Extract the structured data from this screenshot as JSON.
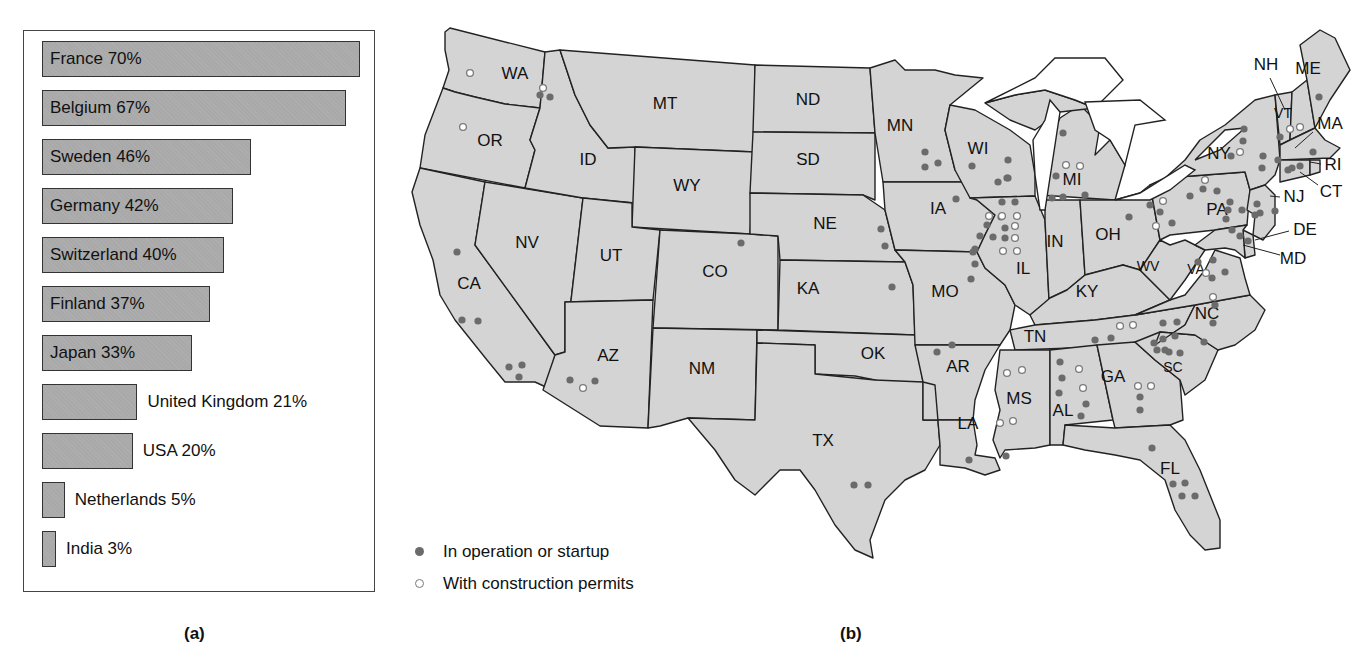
{
  "panel_a": {
    "caption": "(a)",
    "bars": [
      {
        "country": "France",
        "percent": 70,
        "label": "France 70%",
        "label_inside": true
      },
      {
        "country": "Belgium",
        "percent": 67,
        "label": "Belgium 67%",
        "label_inside": true
      },
      {
        "country": "Sweden",
        "percent": 46,
        "label": "Sweden 46%",
        "label_inside": true
      },
      {
        "country": "Germany",
        "percent": 42,
        "label": "Germany 42%",
        "label_inside": true
      },
      {
        "country": "Switzerland",
        "percent": 40,
        "label": "Switzerland 40%",
        "label_inside": true
      },
      {
        "country": "Finland",
        "percent": 37,
        "label": "Finland 37%",
        "label_inside": true
      },
      {
        "country": "Japan",
        "percent": 33,
        "label": "Japan 33%",
        "label_inside": true
      },
      {
        "country": "United Kingdom",
        "percent": 21,
        "label": "United Kingdom 21%",
        "label_inside": false
      },
      {
        "country": "USA",
        "percent": 20,
        "label": "USA 20%",
        "label_inside": false
      },
      {
        "country": "Netherlands",
        "percent": 5,
        "label": "Netherlands 5%",
        "label_inside": false
      },
      {
        "country": "India",
        "percent": 3,
        "label": "India 3%",
        "label_inside": false
      }
    ]
  },
  "panel_b": {
    "caption": "(b)",
    "legend": {
      "operating": "In operation or startup",
      "permits": "With construction permits"
    },
    "colors": {
      "state_fill": "#d4d4d4",
      "operating_dot": "#6b6b6b",
      "permit_dot_stroke": "#7a7a7a"
    },
    "states": [
      "WA",
      "OR",
      "CA",
      "NV",
      "ID",
      "MT",
      "WY",
      "UT",
      "AZ",
      "CO",
      "NM",
      "ND",
      "SD",
      "NE",
      "KA",
      "OK",
      "TX",
      "MN",
      "IA",
      "MO",
      "AR",
      "LA",
      "WI",
      "IL",
      "MI",
      "IN",
      "OH",
      "KY",
      "TN",
      "MS",
      "AL",
      "GA",
      "FL",
      "SC",
      "NC",
      "VA",
      "WV",
      "PA",
      "NY",
      "VT",
      "NH",
      "ME",
      "MA",
      "RI",
      "CT",
      "NJ",
      "DE",
      "MD"
    ]
  },
  "chart_data": [
    {
      "type": "bar",
      "orientation": "horizontal",
      "title": "",
      "categories": [
        "France",
        "Belgium",
        "Sweden",
        "Germany",
        "Switzerland",
        "Finland",
        "Japan",
        "United Kingdom",
        "USA",
        "Netherlands",
        "India"
      ],
      "values": [
        70,
        67,
        46,
        42,
        40,
        37,
        33,
        21,
        20,
        5,
        3
      ],
      "unit": "%",
      "xlabel": "",
      "ylabel": "",
      "grid": false,
      "caption": "(a)"
    },
    {
      "type": "map",
      "caption": "(b)",
      "legend": [
        "In operation or startup",
        "With construction permits"
      ],
      "legend_position": "bottom-left",
      "plants_by_state": {
        "WA": {
          "operating": 2,
          "permits": 2
        },
        "OR": {
          "operating": 0,
          "permits": 1
        },
        "CA": {
          "operating": 6,
          "permits": 0
        },
        "AZ": {
          "operating": 2,
          "permits": 1
        },
        "CO": {
          "operating": 1,
          "permits": 0
        },
        "NE": {
          "operating": 2,
          "permits": 0
        },
        "KA": {
          "operating": 1,
          "permits": 0
        },
        "TX": {
          "operating": 2,
          "permits": 0
        },
        "MN": {
          "operating": 3,
          "permits": 0
        },
        "IA": {
          "operating": 1,
          "permits": 0
        },
        "MO": {
          "operating": 2,
          "permits": 0
        },
        "AR": {
          "operating": 2,
          "permits": 0
        },
        "LA": {
          "operating": 2,
          "permits": 0
        },
        "WI": {
          "operating": 5,
          "permits": 0
        },
        "IL": {
          "operating": 10,
          "permits": 7
        },
        "MI": {
          "operating": 5,
          "permits": 2
        },
        "OH": {
          "operating": 2,
          "permits": 1
        },
        "TN": {
          "operating": 2,
          "permits": 2
        },
        "MS": {
          "operating": 0,
          "permits": 4
        },
        "AL": {
          "operating": 5,
          "permits": 2
        },
        "GA": {
          "operating": 2,
          "permits": 2
        },
        "FL": {
          "operating": 5,
          "permits": 0
        },
        "SC": {
          "operating": 8,
          "permits": 0
        },
        "NC": {
          "operating": 4,
          "permits": 1
        },
        "VA": {
          "operating": 4,
          "permits": 1
        },
        "PA": {
          "operating": 9,
          "permits": 2
        },
        "NY": {
          "operating": 6,
          "permits": 1
        },
        "VT": {
          "operating": 1,
          "permits": 0
        },
        "NH": {
          "operating": 0,
          "permits": 2
        },
        "ME": {
          "operating": 1,
          "permits": 0
        },
        "MA": {
          "operating": 1,
          "permits": 0
        },
        "CT": {
          "operating": 3,
          "permits": 0
        },
        "NJ": {
          "operating": 4,
          "permits": 0
        },
        "MD": {
          "operating": 3,
          "permits": 0
        }
      }
    }
  ]
}
